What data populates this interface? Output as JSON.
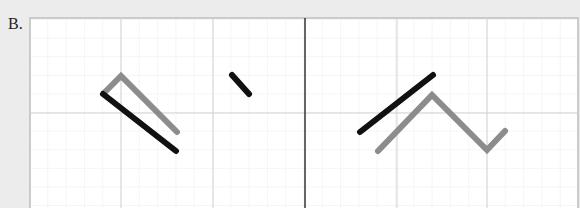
{
  "label": "B.",
  "colors": {
    "background": "#ececec",
    "panel": "#ffffff",
    "panel_border": "#bdbdbd",
    "minor_grid": "#ececec",
    "major_grid": "#d2d2d2",
    "divider": "#333333",
    "black_stroke": "#111111",
    "gray_stroke": "#8c8c8c"
  },
  "panels": [
    {
      "name": "left",
      "segments": [
        {
          "color": "gray",
          "points": [
            [
              104,
              93
            ],
            [
              121,
              76
            ],
            [
              177,
              132
            ]
          ]
        },
        {
          "color": "black",
          "points": [
            [
              103,
              94
            ],
            [
              176,
              151
            ]
          ]
        },
        {
          "color": "black",
          "points": [
            [
              232,
              75
            ],
            [
              249,
              94
            ]
          ]
        }
      ]
    },
    {
      "name": "right",
      "segments": [
        {
          "color": "black",
          "points": [
            [
              360,
              132
            ],
            [
              433,
              75
            ]
          ]
        },
        {
          "color": "gray",
          "points": [
            [
              378,
              151
            ],
            [
              432,
              95
            ],
            [
              487,
              150
            ],
            [
              505,
              131
            ]
          ]
        }
      ]
    }
  ]
}
